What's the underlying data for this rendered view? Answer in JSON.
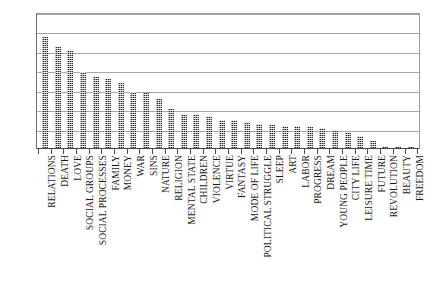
{
  "chart_data": {
    "type": "bar",
    "title": "",
    "subtitle": "",
    "xlabel": "",
    "ylabel": "",
    "ylim": [
      0,
      140
    ],
    "yticks": [
      0,
      20,
      40,
      60,
      80,
      100,
      120,
      140
    ],
    "grid": true,
    "legend": null,
    "legend_position": "none",
    "orientation": "vertical",
    "bar_style": "dotted-texture-dark",
    "categories": [
      "RELATIONS",
      "DEATH",
      "LOVE",
      "SOCIAL GROUPS",
      "SOCIAL PROCESSES",
      "FAMILY",
      "MONEY",
      "WAR",
      "SINS",
      "NATURE",
      "RELIGION",
      "MENTAL STATE",
      "CHILDREN",
      "VIOLENCE",
      "VIRTUE",
      "FANTASY",
      "MODE OF LIFE",
      "POLITICAL STRUGGLE",
      "SLEEP",
      "ART",
      "LABOR",
      "PROGRESS",
      "DREAM",
      "YOUNG PEOPLE",
      "CITY LIFE",
      "LEISURE TIME",
      "FUTURE",
      "REVOLUTION",
      "BEAUTY",
      "FREEDOM"
    ],
    "values": [
      115,
      105,
      102,
      79,
      74,
      72,
      68,
      59,
      58,
      51,
      41,
      36,
      36,
      34,
      30,
      30,
      28,
      26,
      25,
      24,
      24,
      23,
      22,
      20,
      17,
      13,
      8,
      3,
      2,
      2
    ]
  },
  "axes": {
    "y_tick_labels": [
      "140",
      "120",
      "100",
      "80",
      "60",
      "40",
      "20",
      "0"
    ]
  },
  "colors": {
    "bar": "#2b2b2b",
    "gridline": "#a8a8a8",
    "axis": "#4a4a4a",
    "text": "#1a1a1a",
    "background": "#ffffff"
  }
}
